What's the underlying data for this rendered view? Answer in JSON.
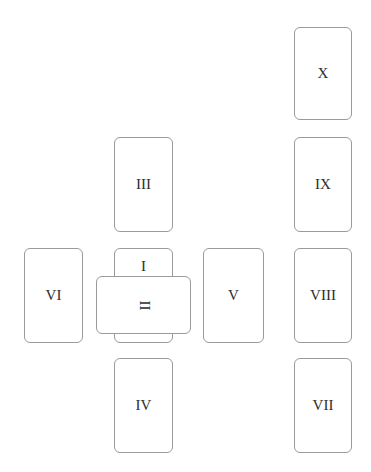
{
  "spread": {
    "cards": [
      {
        "position": "I",
        "label": "I"
      },
      {
        "position": "II",
        "label": "II"
      },
      {
        "position": "III",
        "label": "III"
      },
      {
        "position": "IV",
        "label": "IV"
      },
      {
        "position": "V",
        "label": "V"
      },
      {
        "position": "VI",
        "label": "VI"
      },
      {
        "position": "VII",
        "label": "VII"
      },
      {
        "position": "VIII",
        "label": "VIII"
      },
      {
        "position": "IX",
        "label": "IX"
      },
      {
        "position": "X",
        "label": "X"
      }
    ]
  },
  "colors": {
    "card_border": "#9a9a9a",
    "card_fill": "#ffffff",
    "label_text": "#2e2e2e",
    "background": "#ffffff"
  }
}
